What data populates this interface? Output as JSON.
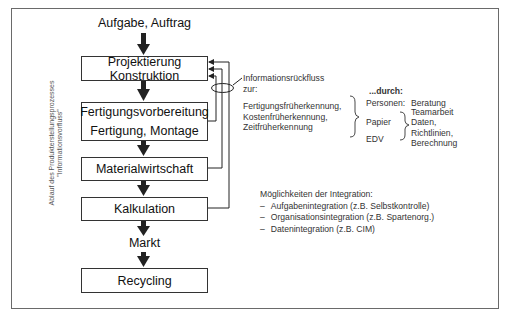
{
  "diagram": {
    "input_label": "Aufgabe, Auftrag",
    "vertical_caption": {
      "line1": "Ablauf des Produkterstellungsprozesses",
      "line2": "\"Informationsvorfluss\""
    },
    "process_boxes": [
      {
        "line1": "Projektierung",
        "line2": "Konstruktion"
      },
      {
        "line1": "Fertigungsvorbereitung",
        "line2": "Fertigung, Montage"
      },
      {
        "line1": "Materialwirtschaft"
      },
      {
        "line1": "Kalkulation"
      }
    ],
    "market_label": "Markt",
    "recycling_box": "Recycling",
    "feedback": {
      "title_line1": "Informationsrückfluss",
      "title_line2": "zur:",
      "items": [
        "Fertigungsfrüherkennung,",
        "Kostenfrüherkennung,",
        "Zeitfrüherkennung"
      ]
    },
    "means": {
      "heading": "...durch:",
      "rows": [
        {
          "label": "Personen:",
          "values": [
            "Beratung",
            "Teamarbeit"
          ]
        },
        {
          "label": "Papier",
          "values": []
        },
        {
          "label": "EDV",
          "values": []
        }
      ],
      "grouped_values": [
        "Daten,",
        "Richtlinien,",
        "Berechnung"
      ]
    },
    "integration": {
      "heading": "Möglichkeiten der Integration:",
      "bullet": "–",
      "items": [
        "Aufgabenintegration (z.B. Selbstkontrolle)",
        "Organisationsintegration (z.B. Spartenorg.)",
        "Datenintegration (z.B. CIM)"
      ]
    },
    "colors": {
      "line": "#222222",
      "frame": "#6a6a6a",
      "text": "#111111"
    }
  }
}
